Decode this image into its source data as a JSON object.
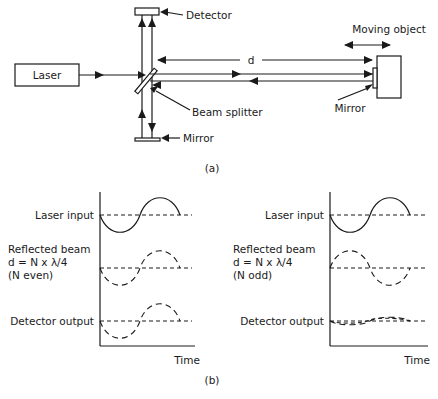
{
  "part_a": {
    "caption": "(a)",
    "laser_label": "Laser",
    "detector_label": "Detector",
    "beam_splitter_label": "Beam splitter",
    "mirror_label_bottom": "Mirror",
    "mirror_label_object": "Mirror",
    "moving_object_label": "Moving object",
    "distance_label": "d"
  },
  "part_b": {
    "caption": "(b)",
    "left_plot": {
      "row1_label": "Laser input",
      "row2_label_line1": "Reflected beam",
      "row2_label_line2": "d = N x λ/4",
      "row2_label_line3": "(N even)",
      "row3_label": "Detector output",
      "x_axis_label": "Time"
    },
    "right_plot": {
      "row1_label": "Laser input",
      "row2_label_line1": "Reflected beam",
      "row2_label_line2": "d = N x λ/4",
      "row2_label_line3": "(N odd)",
      "row3_label": "Detector output",
      "x_axis_label": "Time"
    }
  },
  "colors": {
    "ink": "#1a1a1a",
    "background": "#ffffff"
  }
}
